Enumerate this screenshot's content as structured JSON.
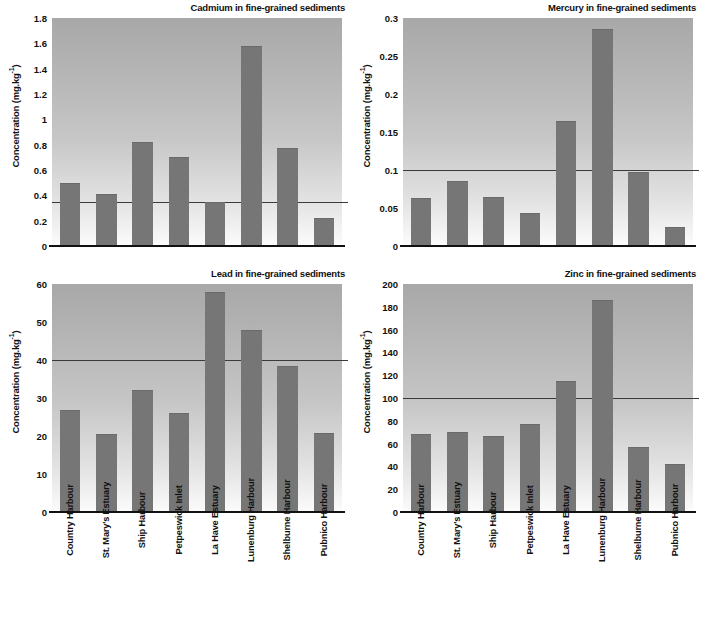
{
  "figure": {
    "categories": [
      "Country Harbour",
      "St. Mary's Estuary",
      "Ship Harbour",
      "Petpeswick Inlet",
      "La Have Estuary",
      "Lunenburg Harbour",
      "Shelburne Harbour",
      "Pubnico Harbour"
    ],
    "ylabel_text": "Concentration (mg.kg",
    "ylabel_sup": "-1",
    "ylabel_close": ")",
    "bar_color": "#767676",
    "guideline_color": "#3a3a3a",
    "axis_color": "#111111"
  },
  "chart_data": [
    {
      "type": "bar",
      "id": "cadmium",
      "title": "Cadmium in fine-grained sediments",
      "xlabel": "",
      "ylabel": "Concentration (mg.kg-1)",
      "ylim": [
        0,
        1.8
      ],
      "yticks": [
        0,
        0.2,
        0.4,
        0.6,
        0.8,
        1,
        1.2,
        1.4,
        1.6,
        1.8
      ],
      "ytick_labels": [
        "0",
        "0.2",
        "0.4",
        "0.6",
        "0.8",
        "1",
        "1.2",
        "1.4",
        "1.6",
        "1.8"
      ],
      "grid": false,
      "legend": "none",
      "guideline": 0.35,
      "categories": [
        "Country Harbour",
        "St. Mary's Estuary",
        "Ship Harbour",
        "Petpeswick Inlet",
        "La Have Estuary",
        "Lunenburg Harbour",
        "Shelburne Harbour",
        "Pubnico Harbour"
      ],
      "values": [
        0.5,
        0.41,
        0.82,
        0.7,
        0.35,
        1.58,
        0.77,
        0.22
      ]
    },
    {
      "type": "bar",
      "id": "mercury",
      "title": "Mercury in fine-grained sediments",
      "xlabel": "",
      "ylabel": "Concentration (mg.kg-1)",
      "ylim": [
        0,
        0.3
      ],
      "yticks": [
        0,
        0.05,
        0.1,
        0.15,
        0.2,
        0.25,
        0.3
      ],
      "ytick_labels": [
        "0",
        "0.05",
        "0.1",
        "0.15",
        "0.2",
        "0.25",
        "0.3"
      ],
      "grid": false,
      "legend": "none",
      "guideline": 0.1,
      "categories": [
        "Country Harbour",
        "St. Mary's Estuary",
        "Ship Harbour",
        "Petpeswick Inlet",
        "La Have Estuary",
        "Lunenburg Harbour",
        "Shelburne Harbour",
        "Pubnico Harbour"
      ],
      "values": [
        0.063,
        0.085,
        0.065,
        0.044,
        0.165,
        0.285,
        0.097,
        0.025
      ]
    },
    {
      "type": "bar",
      "id": "lead",
      "title": "Lead in fine-grained sediments",
      "xlabel": "",
      "ylabel": "Concentration (mg.kg-1)",
      "ylim": [
        0,
        60
      ],
      "yticks": [
        0,
        10,
        20,
        30,
        40,
        50,
        60
      ],
      "ytick_labels": [
        "0",
        "10",
        "20",
        "30",
        "40",
        "50",
        "60"
      ],
      "grid": false,
      "legend": "none",
      "guideline": 40,
      "categories": [
        "Country Harbour",
        "St. Mary's Estuary",
        "Ship Harbour",
        "Petpeswick Inlet",
        "La Have Estuary",
        "Lunenburg Harbour",
        "Shelburne Harbour",
        "Pubnico Harbour"
      ],
      "values": [
        26.8,
        20.6,
        32.2,
        26.0,
        58.0,
        47.8,
        38.3,
        20.9
      ]
    },
    {
      "type": "bar",
      "id": "zinc",
      "title": "Zinc in fine-grained sediments",
      "xlabel": "",
      "ylabel": "Concentration (mg.kg-1)",
      "ylim": [
        0,
        200
      ],
      "yticks": [
        0,
        20,
        40,
        60,
        80,
        100,
        120,
        140,
        160,
        180,
        200
      ],
      "ytick_labels": [
        "0",
        "20",
        "40",
        "60",
        "80",
        "100",
        "120",
        "140",
        "160",
        "180",
        "200"
      ],
      "grid": false,
      "legend": "none",
      "guideline": 100,
      "categories": [
        "Country Harbour",
        "St. Mary's Estuary",
        "Ship Harbour",
        "Petpeswick Inlet",
        "La Have Estuary",
        "Lunenburg Harbour",
        "Shelburne Harbour",
        "Pubnico Harbour"
      ],
      "values": [
        68,
        70,
        67,
        77,
        115,
        186,
        57,
        42
      ]
    }
  ]
}
